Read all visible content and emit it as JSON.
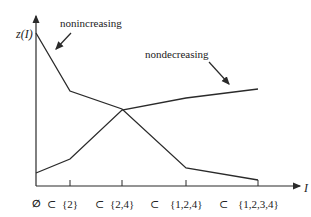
{
  "diagram": {
    "y_axis_label": "z(I)",
    "x_axis_label": "I",
    "x_ticks": [
      {
        "label": "∅",
        "x": 36
      },
      {
        "label": "{2}",
        "x": 70
      },
      {
        "label": "{2,4}",
        "x": 122
      },
      {
        "label": "{1,2,4}",
        "x": 186
      },
      {
        "label": "{1,2,3,4}",
        "x": 258
      }
    ],
    "subset_symbol": "⊂",
    "curves": [
      {
        "name": "nonincreasing",
        "label": "nonincreasing",
        "points": [
          [
            36,
            33
          ],
          [
            70,
            91
          ],
          [
            122,
            109
          ],
          [
            186,
            168
          ],
          [
            258,
            180
          ]
        ]
      },
      {
        "name": "nondecreasing",
        "label": "nondecreasing",
        "points": [
          [
            36,
            173
          ],
          [
            70,
            159
          ],
          [
            122,
            110
          ],
          [
            186,
            98
          ],
          [
            258,
            89
          ]
        ]
      }
    ],
    "line_color": "#2a2a2a"
  }
}
